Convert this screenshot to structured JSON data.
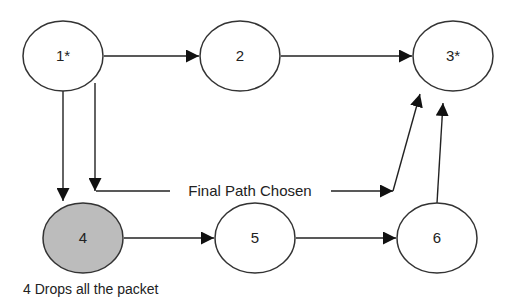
{
  "diagram": {
    "nodes": [
      {
        "id": "1",
        "label": "1*",
        "cx": 63,
        "cy": 56,
        "state": "normal"
      },
      {
        "id": "2",
        "label": "2",
        "cx": 240,
        "cy": 56,
        "state": "normal"
      },
      {
        "id": "3",
        "label": "3*",
        "cx": 453,
        "cy": 56,
        "state": "normal"
      },
      {
        "id": "4",
        "label": "4",
        "cx": 83,
        "cy": 238,
        "state": "dropped"
      },
      {
        "id": "5",
        "label": "5",
        "cx": 255,
        "cy": 238,
        "state": "normal"
      },
      {
        "id": "6",
        "label": "6",
        "cx": 437,
        "cy": 238,
        "state": "normal"
      }
    ],
    "edges": [
      {
        "from": "1",
        "to": "2"
      },
      {
        "from": "2",
        "to": "3"
      },
      {
        "from": "1",
        "to": "4"
      },
      {
        "from": "4",
        "to": "5"
      },
      {
        "from": "5",
        "to": "6"
      },
      {
        "from": "6",
        "to": "3"
      },
      {
        "from": "1",
        "to": "3",
        "via": "final-path"
      }
    ],
    "final_path_label": "Final Path Chosen",
    "note": "4 Drops all the packet",
    "colors": {
      "dropped_fill": "#bcbcbc",
      "stroke": "#333333"
    }
  }
}
